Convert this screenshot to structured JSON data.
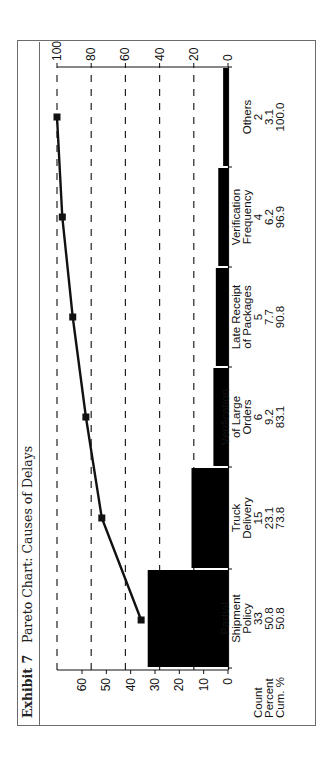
{
  "header": {
    "exhibit": "Exhibit 7",
    "title": "Pareto Chart: Causes of Delays"
  },
  "table_rows": {
    "count_label": "Count",
    "percent_label": "Percent",
    "cum_label": "Cum. %"
  },
  "categories": [
    {
      "name_lines": [
        "Partial",
        "Shipment",
        "Policy"
      ],
      "count": "33",
      "percent": "50.8",
      "cum": "50.8"
    },
    {
      "name_lines": [
        "Truck",
        "Delivery"
      ],
      "count": "15",
      "percent": "23.1",
      "cum": "73.8"
    },
    {
      "name_lines": [
        "Verification",
        "of Large",
        "Orders"
      ],
      "count": "6",
      "percent": "9.2",
      "cum": "83.1"
    },
    {
      "name_lines": [
        "Late Receipt",
        "of Packages"
      ],
      "count": "5",
      "percent": "7.7",
      "cum": "90.8"
    },
    {
      "name_lines": [
        "Verification",
        "Frequency"
      ],
      "count": "4",
      "percent": "6.2",
      "cum": "96.9"
    },
    {
      "name_lines": [
        "Others"
      ],
      "count": "2",
      "percent": "3.1",
      "cum": "100.0"
    }
  ],
  "colors": {
    "bar": "#000000",
    "line": "#111111",
    "grid": "#222222",
    "frame": "#6b6b6b"
  },
  "chart_data": {
    "type": "bar",
    "subtype": "pareto",
    "title": "Exhibit 7 Pareto Chart: Causes of Delays",
    "orientation_note": "figure rotated 90 degrees counter-clockwise in the page",
    "categories": [
      "Partial Shipment Policy",
      "Truck Delivery",
      "Verification of Large Orders",
      "Late Receipt of Packages",
      "Verification Frequency",
      "Others"
    ],
    "series": [
      {
        "name": "Count",
        "type": "bar",
        "axis": "left",
        "values": [
          33,
          15,
          6,
          5,
          4,
          2
        ]
      },
      {
        "name": "Cum. %",
        "type": "line",
        "axis": "right",
        "markers": "square",
        "values": [
          50.8,
          73.8,
          83.1,
          90.8,
          96.9,
          100.0
        ]
      }
    ],
    "percent": [
      50.8,
      23.1,
      9.2,
      7.7,
      6.2,
      3.1
    ],
    "left_axis": {
      "label": "",
      "ticks": [
        0,
        10,
        20,
        30,
        40,
        50,
        60
      ],
      "range": [
        0,
        70
      ]
    },
    "right_axis": {
      "label": "",
      "ticks": [
        0,
        20,
        40,
        60,
        80,
        100
      ],
      "range": [
        0,
        100
      ]
    },
    "grid": {
      "horizontal_dashed_at_percent": [
        20,
        40,
        60,
        80,
        100
      ]
    },
    "table_rows": [
      "Count",
      "Percent",
      "Cum. %"
    ],
    "legend": "none"
  }
}
